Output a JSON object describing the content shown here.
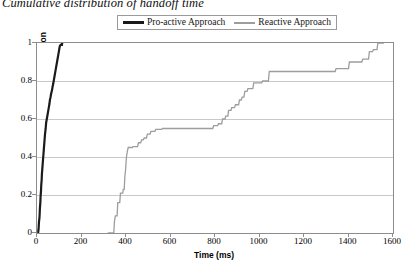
{
  "title": "Cumulative distribution of handoff time",
  "legend": {
    "position": "top-center",
    "entries": [
      {
        "label": "Pro-active Approach",
        "color": "#1a1a1a",
        "style": "thick-solid"
      },
      {
        "label": "Reactive Approach",
        "color": "#9d9d9d",
        "style": "thin-solid"
      }
    ]
  },
  "axes": {
    "x": {
      "label": "Time (ms)",
      "ticks": [
        "0",
        "200",
        "400",
        "600",
        "800",
        "1000",
        "1200",
        "1400",
        "1600"
      ],
      "min": 0,
      "max": 1600
    },
    "y": {
      "label": "Cumulative Distribution",
      "ticks": [
        "0",
        "0.2",
        "0.4",
        "0.6",
        "0.8",
        "1"
      ],
      "min": 0,
      "max": 1
    }
  },
  "chart_data": {
    "type": "line",
    "title": "Cumulative distribution of handoff time",
    "xlabel": "Time (ms)",
    "ylabel": "Cumulative Distribution",
    "xlim": [
      0,
      1600
    ],
    "ylim": [
      0,
      1
    ],
    "xticks": [
      0,
      200,
      400,
      600,
      800,
      1000,
      1200,
      1400,
      1600
    ],
    "yticks": [
      0,
      0.2,
      0.4,
      0.6,
      0.8,
      1
    ],
    "grid": "horizontal",
    "legend_position": "top-center",
    "series": [
      {
        "name": "Pro-active Approach",
        "color": "#1a1a1a",
        "linewidth": 2.2,
        "points": [
          [
            5,
            0.0
          ],
          [
            7,
            0.02
          ],
          [
            8,
            0.04
          ],
          [
            9,
            0.06
          ],
          [
            11,
            0.08
          ],
          [
            12,
            0.1
          ],
          [
            13,
            0.13
          ],
          [
            15,
            0.16
          ],
          [
            16,
            0.19
          ],
          [
            18,
            0.22
          ],
          [
            19,
            0.25
          ],
          [
            21,
            0.28
          ],
          [
            22,
            0.31
          ],
          [
            24,
            0.34
          ],
          [
            26,
            0.37
          ],
          [
            28,
            0.4
          ],
          [
            30,
            0.43
          ],
          [
            32,
            0.46
          ],
          [
            34,
            0.49
          ],
          [
            36,
            0.52
          ],
          [
            39,
            0.55
          ],
          [
            41,
            0.58
          ],
          [
            44,
            0.6
          ],
          [
            47,
            0.62
          ],
          [
            50,
            0.64
          ],
          [
            53,
            0.66
          ],
          [
            56,
            0.68
          ],
          [
            58,
            0.7
          ],
          [
            61,
            0.715
          ],
          [
            63,
            0.73
          ],
          [
            66,
            0.745
          ],
          [
            68,
            0.755
          ],
          [
            70,
            0.77
          ],
          [
            73,
            0.785
          ],
          [
            75,
            0.8
          ],
          [
            78,
            0.82
          ],
          [
            81,
            0.84
          ],
          [
            84,
            0.86
          ],
          [
            87,
            0.88
          ],
          [
            90,
            0.9
          ],
          [
            93,
            0.92
          ],
          [
            96,
            0.94
          ],
          [
            99,
            0.96
          ],
          [
            101,
            0.975
          ],
          [
            103,
            0.985
          ],
          [
            106,
            0.99
          ],
          [
            112,
            0.99
          ],
          [
            113,
            1.0
          ],
          [
            118,
            1.0
          ]
        ]
      },
      {
        "name": "Reactive Approach",
        "color": "#9d9d9d",
        "linewidth": 1.3,
        "points": [
          [
            318,
            0.0
          ],
          [
            345,
            0.0
          ],
          [
            348,
            0.06
          ],
          [
            352,
            0.09
          ],
          [
            360,
            0.09
          ],
          [
            363,
            0.16
          ],
          [
            372,
            0.16
          ],
          [
            375,
            0.21
          ],
          [
            385,
            0.21
          ],
          [
            388,
            0.23
          ],
          [
            392,
            0.23
          ],
          [
            395,
            0.3
          ],
          [
            398,
            0.33
          ],
          [
            402,
            0.4
          ],
          [
            406,
            0.43
          ],
          [
            410,
            0.45
          ],
          [
            428,
            0.45
          ],
          [
            432,
            0.455
          ],
          [
            452,
            0.455
          ],
          [
            456,
            0.475
          ],
          [
            466,
            0.475
          ],
          [
            470,
            0.49
          ],
          [
            478,
            0.49
          ],
          [
            482,
            0.5
          ],
          [
            492,
            0.5
          ],
          [
            496,
            0.52
          ],
          [
            508,
            0.52
          ],
          [
            512,
            0.535
          ],
          [
            530,
            0.535
          ],
          [
            534,
            0.545
          ],
          [
            560,
            0.545
          ],
          [
            564,
            0.55
          ],
          [
            790,
            0.55
          ],
          [
            794,
            0.565
          ],
          [
            812,
            0.565
          ],
          [
            816,
            0.575
          ],
          [
            830,
            0.575
          ],
          [
            834,
            0.6
          ],
          [
            845,
            0.6
          ],
          [
            848,
            0.615
          ],
          [
            858,
            0.615
          ],
          [
            861,
            0.645
          ],
          [
            872,
            0.645
          ],
          [
            875,
            0.66
          ],
          [
            888,
            0.66
          ],
          [
            892,
            0.675
          ],
          [
            906,
            0.675
          ],
          [
            910,
            0.7
          ],
          [
            918,
            0.7
          ],
          [
            922,
            0.715
          ],
          [
            930,
            0.715
          ],
          [
            934,
            0.745
          ],
          [
            944,
            0.745
          ],
          [
            948,
            0.76
          ],
          [
            970,
            0.76
          ],
          [
            974,
            0.79
          ],
          [
            1010,
            0.79
          ],
          [
            1014,
            0.8
          ],
          [
            1040,
            0.8
          ],
          [
            1044,
            0.85
          ],
          [
            1340,
            0.85
          ],
          [
            1344,
            0.865
          ],
          [
            1400,
            0.865
          ],
          [
            1404,
            0.9
          ],
          [
            1460,
            0.9
          ],
          [
            1464,
            0.915
          ],
          [
            1490,
            0.915
          ],
          [
            1494,
            0.955
          ],
          [
            1508,
            0.955
          ],
          [
            1512,
            0.965
          ],
          [
            1528,
            0.965
          ],
          [
            1532,
            1.0
          ],
          [
            1560,
            1.0
          ]
        ]
      }
    ]
  }
}
